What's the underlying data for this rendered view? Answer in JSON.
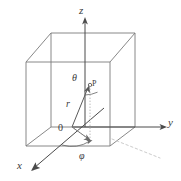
{
  "figure": {
    "kind": "spherical-coordinate-diagram",
    "colors": {
      "cube_edge": "#7b7b7b",
      "axis": "#4a4a4a",
      "ray": "#5a5a5a",
      "dotted": "#b9b9b9",
      "label": "#3a3a3a",
      "background": "#ffffff"
    },
    "axes": [
      {
        "name": "z-axis",
        "label": "z",
        "direction": "up"
      },
      {
        "name": "y-axis",
        "label": "y",
        "direction": "right"
      },
      {
        "name": "x-axis",
        "label": "x",
        "direction": "down-left"
      }
    ],
    "labels": {
      "z": "z",
      "y": "y",
      "x": "x",
      "origin": "0",
      "point": "P",
      "radius": "r",
      "polar_angle": "θ",
      "azimuthal_angle": "φ"
    },
    "geometry": {
      "origin": [
        72,
        127
      ],
      "point_p": [
        90,
        86
      ],
      "cube_front_bottom_left": [
        26,
        146
      ],
      "cube_front_bottom_right": [
        110,
        146
      ],
      "cube_front_top_left": [
        26,
        62
      ],
      "cube_front_top_right": [
        110,
        62
      ],
      "cube_back_bottom_left": [
        51,
        127
      ],
      "cube_back_bottom_right": [
        135,
        127
      ],
      "cube_back_top_left": [
        51,
        33
      ],
      "cube_back_top_right": [
        135,
        33
      ],
      "z_axis_tip": [
        85,
        18
      ],
      "y_axis_tip": [
        166,
        127
      ],
      "x_axis_tip": [
        32,
        170
      ]
    }
  }
}
